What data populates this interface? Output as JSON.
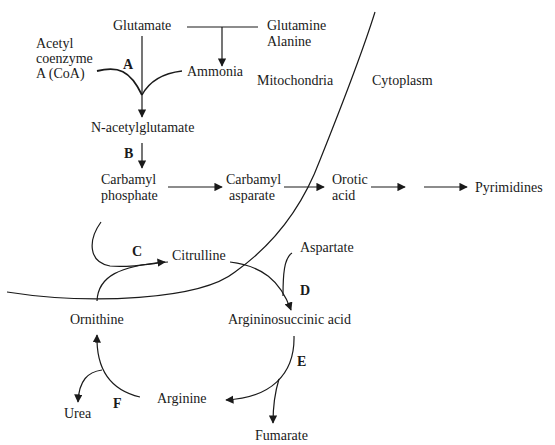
{
  "diagram": {
    "type": "metabolic-pathway",
    "compartments": {
      "mitochondria": "Mitochondria",
      "cytoplasm": "Cytoplasm"
    },
    "metabolites": {
      "glutamate": "Glutamate",
      "glutamine_line1": "Glutamine",
      "glutamine_line2": "Alanine",
      "acetyl_coa_line1": "Acetyl",
      "acetyl_coa_line2": "coenzyme",
      "acetyl_coa_line3": "A (CoA)",
      "ammonia": "Ammonia",
      "n_acetylglutamate": "N-acetylglutamate",
      "carbamyl_phosphate_line1": "Carbamyl",
      "carbamyl_phosphate_line2": "phosphate",
      "carbamyl_asparate_line1": "Carbamyl",
      "carbamyl_asparate_line2": "asparate",
      "orotic_acid_line1": "Orotic",
      "orotic_acid_line2": "acid",
      "pyrimidines": "Pyrimidines",
      "citrulline": "Citrulline",
      "aspartate": "Aspartate",
      "ornithine": "Ornithine",
      "argininosuccinic_acid": "Argininosuccinic acid",
      "arginine": "Arginine",
      "urea": "Urea",
      "fumarate": "Fumarate"
    },
    "enzymes": {
      "a": "A",
      "b": "B",
      "c": "C",
      "d": "D",
      "e": "E",
      "f": "F"
    },
    "edges": [
      {
        "from": "Glutamine/Alanine",
        "to": "Ammonia"
      },
      {
        "from": "Glutamate",
        "to": "N-acetylglutamate",
        "enzyme": "A",
        "cofactors": [
          "Acetyl coenzyme A (CoA)",
          "Ammonia"
        ]
      },
      {
        "from": "N-acetylglutamate",
        "to": "Carbamyl phosphate",
        "enzyme": "B"
      },
      {
        "from": "Carbamyl phosphate",
        "to": "Carbamyl asparate"
      },
      {
        "from": "Carbamyl asparate",
        "to": "Orotic acid"
      },
      {
        "from": "Orotic acid",
        "to": "Pyrimidines"
      },
      {
        "from": "Carbamyl phosphate",
        "to": "Citrulline",
        "enzyme": "C",
        "cofactors": [
          "Ornithine"
        ]
      },
      {
        "from": "Citrulline",
        "to": "Argininosuccinic acid",
        "enzyme": "D",
        "cofactors": [
          "Aspartate"
        ]
      },
      {
        "from": "Argininosuccinic acid",
        "to": "Arginine",
        "enzyme": "E",
        "byproduct": "Fumarate"
      },
      {
        "from": "Arginine",
        "to": "Ornithine",
        "enzyme": "F",
        "byproduct": "Urea"
      }
    ]
  }
}
